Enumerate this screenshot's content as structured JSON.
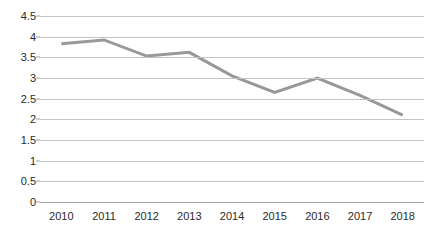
{
  "chart_data": {
    "type": "line",
    "title": "",
    "xlabel": "",
    "ylabel": "",
    "categories": [
      "2010",
      "2011",
      "2012",
      "2013",
      "2014",
      "2015",
      "2016",
      "2017",
      "2018"
    ],
    "values": [
      3.83,
      3.92,
      3.53,
      3.62,
      3.05,
      2.65,
      3.0,
      2.58,
      2.1
    ],
    "series": [
      {
        "name": "",
        "values": [
          3.83,
          3.92,
          3.53,
          3.62,
          3.05,
          2.65,
          3.0,
          2.58,
          2.1
        ]
      }
    ],
    "ylim": [
      0,
      4.5
    ],
    "ytick_labels": [
      "4.5",
      "4",
      "3.5",
      "3",
      "2.5",
      "2",
      "1.5",
      "1",
      "0.5",
      "0"
    ],
    "ytick_values": [
      4.5,
      4,
      3.5,
      3,
      2.5,
      2,
      1.5,
      1,
      0.5,
      0
    ],
    "grid": true,
    "legend": "none",
    "line_color": "#989898",
    "grid_color": "#c3c3c3",
    "axis_color": "#9f9f9f",
    "label_color": "#2b2b2b",
    "background": "#ffffff"
  }
}
